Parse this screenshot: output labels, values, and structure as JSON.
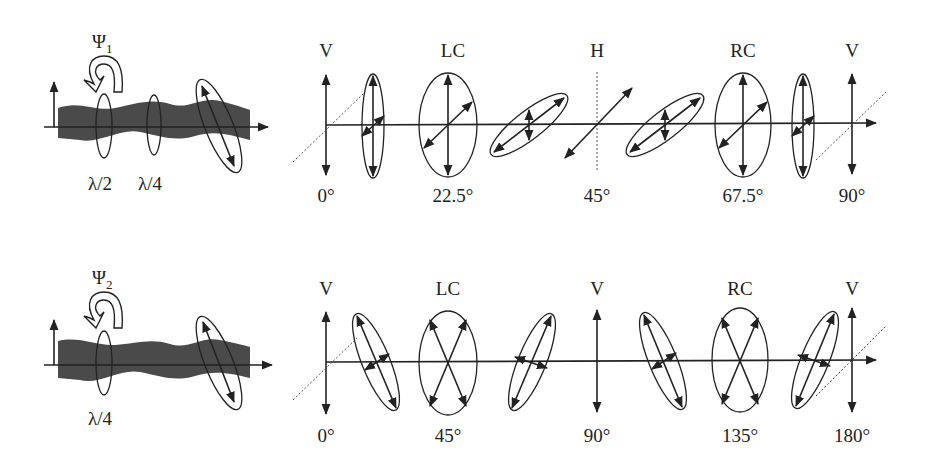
{
  "rows": [
    {
      "id": "row1",
      "y_axis": 125,
      "rotation_label": "Ψ",
      "rotation_sub": "1",
      "plate_labels": [
        "λ/2",
        "λ/4"
      ],
      "state_labels": [
        {
          "text": "V",
          "x": 326
        },
        {
          "text": "LC",
          "x": 453
        },
        {
          "text": "H",
          "x": 597
        },
        {
          "text": "RC",
          "x": 743
        },
        {
          "text": "V",
          "x": 852
        }
      ],
      "angle_labels": [
        {
          "text": "0°",
          "x": 326
        },
        {
          "text": "22.5°",
          "x": 453
        },
        {
          "text": "45°",
          "x": 597
        },
        {
          "text": "67.5°",
          "x": 743
        },
        {
          "text": "90°",
          "x": 852
        }
      ]
    },
    {
      "id": "row2",
      "y_axis": 362,
      "rotation_label": "Ψ",
      "rotation_sub": "2",
      "plate_labels": [
        "λ/4"
      ],
      "state_labels": [
        {
          "text": "V",
          "x": 326
        },
        {
          "text": "LC",
          "x": 448
        },
        {
          "text": "V",
          "x": 597
        },
        {
          "text": "RC",
          "x": 740
        },
        {
          "text": "V",
          "x": 852
        }
      ],
      "angle_labels": [
        {
          "text": "0°",
          "x": 326
        },
        {
          "text": "45°",
          "x": 448
        },
        {
          "text": "90°",
          "x": 597
        },
        {
          "text": "135°",
          "x": 740
        },
        {
          "text": "180°",
          "x": 852
        }
      ]
    }
  ],
  "colors": {
    "ink": "#222222",
    "wave": "#4a4a4a",
    "dotted": "#555555"
  }
}
